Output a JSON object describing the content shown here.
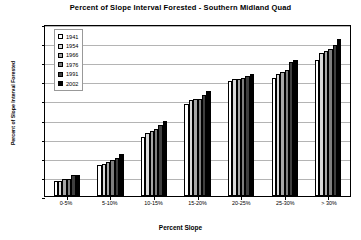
{
  "chart_data": {
    "type": "bar",
    "title": "Percent of Slope Interval Forested - Southern Midland Quad",
    "xlabel": "Percent Slope",
    "ylabel": "Percent of Slope Interval Forested",
    "categories": [
      "0-5%",
      "5-10%",
      "10-15%",
      "15-20%",
      "20-25%",
      "25-30%",
      "> 30%"
    ],
    "ylim": [
      0,
      90
    ],
    "yticks": [
      "0%",
      "10%",
      "20%",
      "30%",
      "40%",
      "50%",
      "60%",
      "70%",
      "80%",
      "90%"
    ],
    "ytick_values": [
      0,
      10,
      20,
      30,
      40,
      50,
      60,
      70,
      80,
      90
    ],
    "grid": true,
    "legend_position": "top-left-inside",
    "series": [
      {
        "name": "1941",
        "color": "#ffffff",
        "values": [
          8,
          16,
          31,
          48,
          60,
          62,
          71
        ]
      },
      {
        "name": "1954",
        "color": "#d9d9d9",
        "values": [
          8,
          17,
          33,
          50,
          61,
          64,
          75
        ]
      },
      {
        "name": "1966",
        "color": "#a6a6a6",
        "values": [
          9,
          18,
          34,
          51,
          61,
          65,
          76
        ]
      },
      {
        "name": "1976",
        "color": "#7f7f7f",
        "values": [
          9,
          19,
          35,
          51,
          62,
          66,
          77
        ]
      },
      {
        "name": "1991",
        "color": "#3f3f3f",
        "values": [
          11,
          20,
          37,
          53,
          63,
          70,
          79
        ]
      },
      {
        "name": "2002",
        "color": "#000000",
        "values": [
          11,
          22,
          39,
          55,
          64,
          71,
          82
        ]
      }
    ]
  }
}
